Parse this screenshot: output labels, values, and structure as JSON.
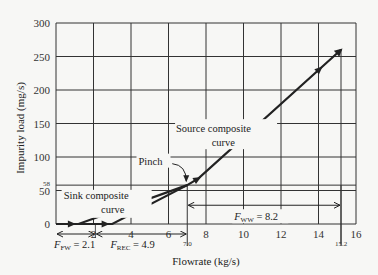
{
  "chart_data": {
    "type": "line",
    "title": "",
    "xlabel": "Flowrate (kg/s)",
    "ylabel": "Impurity load (mg/s)",
    "xlim": [
      0,
      16
    ],
    "ylim": [
      0,
      300
    ],
    "grid": true,
    "x_ticks": [
      "0",
      "2",
      "4",
      "6",
      "8",
      "10",
      "12",
      "14",
      "16"
    ],
    "x_tick_values": [
      0,
      2,
      4,
      6,
      8,
      10,
      12,
      14,
      16
    ],
    "y_ticks": [
      "0",
      "50",
      "100",
      "150",
      "200",
      "250",
      "300"
    ],
    "y_tick_values": [
      0,
      50,
      100,
      150,
      200,
      250,
      300
    ],
    "extra_x_ticks": [
      {
        "value": 7.0,
        "label": "7.0"
      },
      {
        "value": 15.2,
        "label": "15.2"
      }
    ],
    "extra_y_ticks": [
      {
        "value": 58,
        "label": "58"
      }
    ],
    "series": [
      {
        "name": "Sink composite curve",
        "points": [
          [
            0,
            0
          ],
          [
            1.2,
            0
          ],
          [
            7.0,
            58
          ]
        ],
        "arrows_at": [
          0.9
        ]
      },
      {
        "name": "Source composite curve",
        "points": [
          [
            1.2,
            0
          ],
          [
            3.0,
            0
          ],
          [
            7.0,
            58
          ],
          [
            7.6,
            68
          ],
          [
            15.2,
            260
          ]
        ],
        "arrows_at": [
          2.7,
          7.6,
          14.1
        ]
      }
    ],
    "annotations": {
      "sink_label_line1": "Sink composite",
      "sink_label_line2": "curve",
      "source_label_line1": "Source composite",
      "source_label_line2": "curve",
      "pinch_label": "Pinch",
      "pinch_point": [
        7.0,
        58
      ],
      "f_fw": {
        "symbol": "F",
        "subscript": "FW",
        "value_text": " = 2.1",
        "from": 0,
        "to": 2.1
      },
      "f_rec": {
        "symbol": "F",
        "subscript": "REC",
        "value_text": " = 4.9",
        "from": 2.1,
        "to": 7.0
      },
      "f_ww": {
        "symbol": "F",
        "subscript": "WW",
        "value_text": " = 8.2",
        "from": 7.0,
        "to": 15.2,
        "at_y": 28
      }
    }
  }
}
